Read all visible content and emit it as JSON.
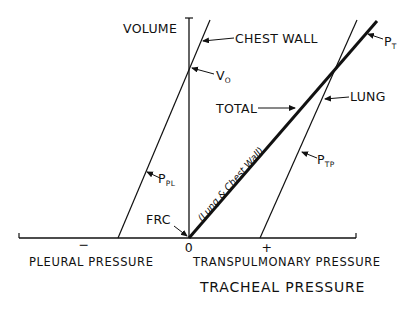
{
  "diagram": {
    "type": "pressure-volume curves",
    "y_axis_label": "VOLUME",
    "x_axis": {
      "title": "TRACHEAL PRESSURE",
      "left_label": "PLEURAL PRESSURE",
      "right_label": "TRANSPULMONARY PRESSURE",
      "minus_sign": "−",
      "zero": "0",
      "plus_sign": "+"
    },
    "curves": {
      "chest_wall": {
        "label": "CHEST WALL"
      },
      "lung": {
        "label": "LUNG"
      },
      "total": {
        "label": "TOTAL",
        "annotation": "(Lung & Chest Wall)"
      }
    },
    "points": {
      "v0": {
        "main": "V",
        "sub": "O"
      },
      "frc": {
        "label": "FRC"
      }
    },
    "pressures": {
      "pt": {
        "main": "P",
        "sub": "T"
      },
      "ppl": {
        "main": "P",
        "sub": "PL"
      },
      "ptp": {
        "main": "P",
        "sub": "TP"
      }
    },
    "colors": {
      "ink": "#111111",
      "background": "#ffffff"
    }
  }
}
